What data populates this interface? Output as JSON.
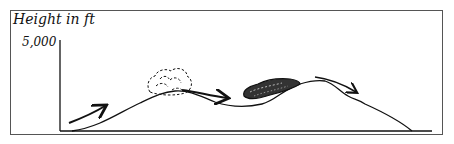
{
  "diagram": {
    "y_axis_label": "Height in ft",
    "y_tick_label": "5,000",
    "elements": [
      {
        "type": "terrain-profile",
        "description": "mountain profile with two peaks"
      },
      {
        "type": "cloud",
        "style": "light dashed",
        "position": "first peak"
      },
      {
        "type": "cloud",
        "style": "dark dense",
        "position": "second peak windward slope"
      },
      {
        "type": "arrow",
        "description": "air flowing up first slope"
      },
      {
        "type": "arrow",
        "description": "air flowing across valley"
      },
      {
        "type": "arrow",
        "description": "air descending leeward slope"
      }
    ],
    "colors": {
      "line": "#111111",
      "border": "#555555",
      "background": "#ffffff"
    }
  }
}
